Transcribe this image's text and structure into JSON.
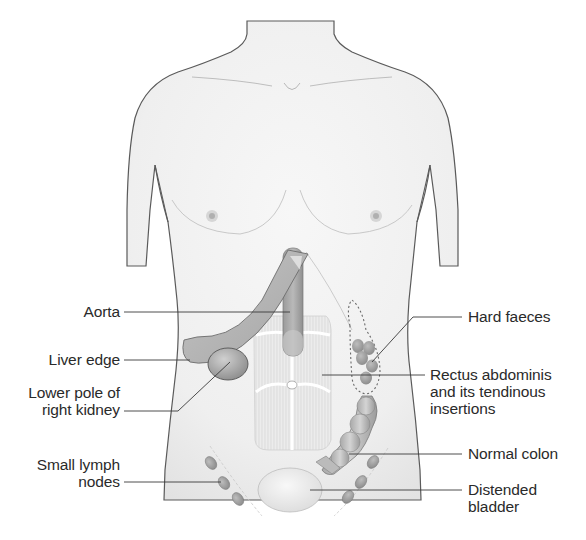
{
  "figure": {
    "colors": {
      "skin": "#f1f1f1",
      "outline": "#555555",
      "organ": "#b5b5b5",
      "organ_dark": "#8e8e8e",
      "muscle": "#e6e6e6",
      "leader_line": "#3a3a3a",
      "text": "#2a2a2a"
    }
  },
  "labels": {
    "left": [
      {
        "id": "aorta",
        "text": "Aorta"
      },
      {
        "id": "liver_edge",
        "text": "Liver edge"
      },
      {
        "id": "right_kidney",
        "text": "Lower pole of\nright kidney"
      },
      {
        "id": "lymph_nodes",
        "text": "Small lymph\nnodes"
      }
    ],
    "right": [
      {
        "id": "hard_faeces",
        "text": "Hard faeces"
      },
      {
        "id": "rectus",
        "text": "Rectus abdominis\nand its tendinous\ninsertions"
      },
      {
        "id": "colon",
        "text": "Normal colon"
      },
      {
        "id": "bladder",
        "text": "Distended\nbladder"
      }
    ]
  }
}
